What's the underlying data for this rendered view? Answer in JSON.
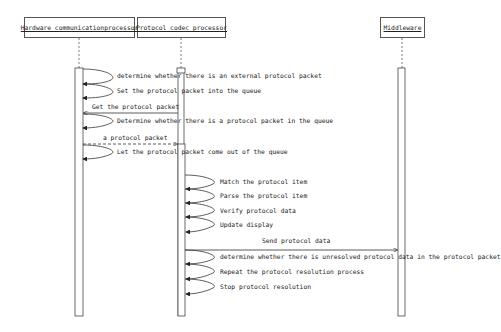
{
  "diagram": {
    "type": "sequence",
    "participants": [
      {
        "id": "hw",
        "label": "Hardware communicationprocessor"
      },
      {
        "id": "codec",
        "label": "Protocol codec processor"
      },
      {
        "id": "mw",
        "label": "Middleware"
      }
    ],
    "messages": [
      {
        "from": "hw",
        "to": "hw",
        "label": "determine whether there is an external protocol packet",
        "style": "self"
      },
      {
        "from": "hw",
        "to": "hw",
        "label": "Set the protocol packet into the queue",
        "style": "self"
      },
      {
        "from": "codec",
        "to": "hw",
        "label": "Get the protocol packet",
        "style": "solid"
      },
      {
        "from": "hw",
        "to": "hw",
        "label": "Determine whether there is a protocol packet in the queue",
        "style": "self"
      },
      {
        "from": "hw",
        "to": "codec",
        "label": "a protocol packet",
        "style": "dashed"
      },
      {
        "from": "hw",
        "to": "hw",
        "label": "Let the protocol packet come out of the queue",
        "style": "self"
      },
      {
        "from": "codec",
        "to": "codec",
        "label": "Match the protocol item",
        "style": "self"
      },
      {
        "from": "codec",
        "to": "codec",
        "label": "Parse the protocol item",
        "style": "self"
      },
      {
        "from": "codec",
        "to": "codec",
        "label": "Verify protocol data",
        "style": "self"
      },
      {
        "from": "codec",
        "to": "codec",
        "label": "Update display",
        "style": "self"
      },
      {
        "from": "codec",
        "to": "mw",
        "label": "Send protocol data",
        "style": "solid"
      },
      {
        "from": "codec",
        "to": "codec",
        "label": "determine whether there is unresolved protocol data in the protocol packet",
        "style": "self"
      },
      {
        "from": "codec",
        "to": "codec",
        "label": "Repeat the protocol resolution process",
        "style": "self"
      },
      {
        "from": "codec",
        "to": "codec",
        "label": "Stop protocol resolution",
        "style": "self"
      }
    ]
  }
}
